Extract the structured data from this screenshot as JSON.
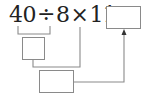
{
  "expression": {
    "operand1": "40",
    "op1": "÷",
    "operand2": "8",
    "op2": "×",
    "operand3": "11",
    "equals": "="
  },
  "boxes": {
    "result_box": "",
    "step1_box": "",
    "step2_box": ""
  },
  "colors": {
    "text": "#222222",
    "line": "#8a8a8a"
  }
}
